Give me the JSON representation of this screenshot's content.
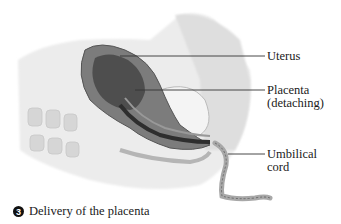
{
  "figure": {
    "labels": [
      {
        "lines": [
          "Uterus"
        ]
      },
      {
        "lines": [
          "Placenta",
          "(detaching)"
        ]
      },
      {
        "lines": [
          "Umbilical",
          "cord"
        ]
      }
    ],
    "caption": {
      "step_number": "3",
      "text": "Delivery of the placenta"
    },
    "colors": {
      "leader_line": "#333333",
      "uterus_dark": "#5a5a5a",
      "tissue_light": "#e4e4e4",
      "background": "#ffffff"
    }
  }
}
